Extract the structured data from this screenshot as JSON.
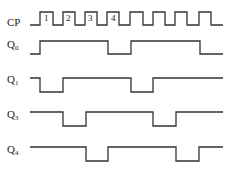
{
  "diagram": {
    "type": "timing-diagram",
    "signals": [
      {
        "name": "CP",
        "base": "CP",
        "sub": "",
        "label_y": 19,
        "high_y": 12,
        "low_y": 25,
        "path": [
          [
            30,
            0
          ],
          [
            40,
            1
          ],
          [
            53,
            0
          ],
          [
            63,
            1
          ],
          [
            75,
            0
          ],
          [
            85,
            1
          ],
          [
            97,
            0
          ],
          [
            107,
            1
          ],
          [
            119,
            0
          ],
          [
            130,
            1
          ],
          [
            143,
            0
          ],
          [
            153,
            1
          ],
          [
            165,
            0
          ],
          [
            175,
            1
          ],
          [
            187,
            0
          ],
          [
            199,
            1
          ],
          [
            211,
            0
          ],
          [
            223,
            0
          ]
        ]
      },
      {
        "name": "Q0",
        "base": "Q",
        "sub": "0",
        "label_y": 41,
        "high_y": 41,
        "low_y": 54,
        "path": [
          [
            30,
            0
          ],
          [
            40,
            1
          ],
          [
            108,
            0
          ],
          [
            131,
            1
          ],
          [
            200,
            0
          ],
          [
            223,
            0
          ]
        ]
      },
      {
        "name": "Q1",
        "base": "Q",
        "sub": "1",
        "label_y": 76,
        "high_y": 78,
        "low_y": 92,
        "path": [
          [
            30,
            1
          ],
          [
            40,
            0
          ],
          [
            63,
            1
          ],
          [
            131,
            0
          ],
          [
            153,
            1
          ],
          [
            223,
            1
          ]
        ]
      },
      {
        "name": "Q3",
        "base": "Q",
        "sub": "3",
        "label_y": 111,
        "high_y": 112,
        "low_y": 126,
        "path": [
          [
            30,
            1
          ],
          [
            63,
            0
          ],
          [
            86,
            1
          ],
          [
            153,
            0
          ],
          [
            176,
            1
          ],
          [
            223,
            1
          ]
        ]
      },
      {
        "name": "Q4",
        "base": "Q",
        "sub": "4",
        "label_y": 146,
        "high_y": 147,
        "low_y": 161,
        "path": [
          [
            30,
            1
          ],
          [
            86,
            0
          ],
          [
            108,
            1
          ],
          [
            176,
            0
          ],
          [
            199,
            1
          ],
          [
            223,
            1
          ]
        ]
      }
    ],
    "pulse_numbers": [
      {
        "text": "1",
        "x": 44,
        "y": 14
      },
      {
        "text": "2",
        "x": 66,
        "y": 14
      },
      {
        "text": "3",
        "x": 88,
        "y": 14
      },
      {
        "text": "4",
        "x": 111,
        "y": 14
      }
    ],
    "line_color": "#333333"
  }
}
